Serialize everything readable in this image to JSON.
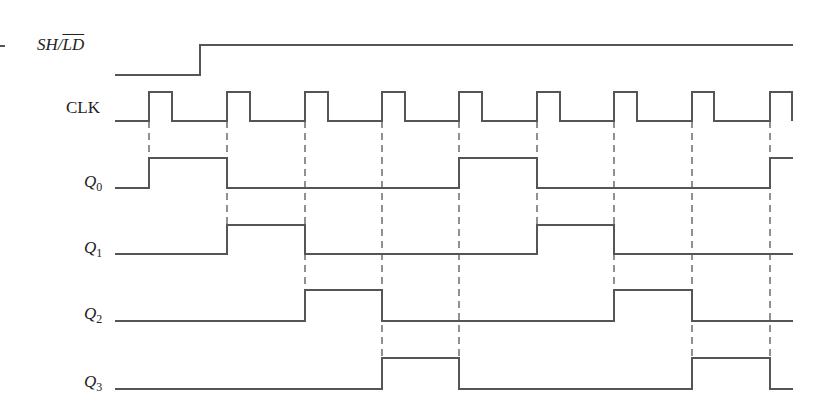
{
  "colors": {
    "signal": "#555555",
    "dashed": "#555555",
    "background": "#ffffff",
    "text": "#222222"
  },
  "signals": [
    {
      "name": "SH/LD",
      "label_main": "SH/",
      "label_over": "LD",
      "italic": true,
      "label_x": 37,
      "label_y": 36,
      "high_y": 45,
      "low_y": 75,
      "x_start": 115,
      "x_end": 793,
      "initial": 0,
      "transitions": [
        200
      ]
    },
    {
      "name": "CLK",
      "label_main": "CLK",
      "italic": false,
      "label_x": 66,
      "label_y": 99,
      "high_y": 92,
      "low_y": 121,
      "x_start": 115,
      "x_end": 792,
      "initial": 0,
      "transitions": [
        149,
        172,
        227,
        250,
        305,
        328,
        382,
        405,
        459,
        482,
        537,
        560,
        614,
        637,
        692,
        714,
        770,
        792
      ]
    },
    {
      "name": "Q0",
      "label_main": "Q",
      "label_sub": "0",
      "italic": true,
      "label_x": 84,
      "label_y": 173,
      "high_y": 158,
      "low_y": 188,
      "x_start": 115,
      "x_end": 793,
      "initial": 0,
      "transitions": [
        149,
        227,
        459,
        537,
        770
      ]
    },
    {
      "name": "Q1",
      "label_main": "Q",
      "label_sub": "1",
      "italic": true,
      "label_x": 84,
      "label_y": 239,
      "high_y": 225,
      "low_y": 254,
      "x_start": 115,
      "x_end": 793,
      "initial": 0,
      "transitions": [
        227,
        305,
        537,
        614
      ]
    },
    {
      "name": "Q2",
      "label_main": "Q",
      "label_sub": "2",
      "italic": true,
      "label_x": 84,
      "label_y": 305,
      "high_y": 290,
      "low_y": 321,
      "x_start": 115,
      "x_end": 793,
      "initial": 0,
      "transitions": [
        305,
        382,
        614,
        692
      ]
    },
    {
      "name": "Q3",
      "label_main": "Q",
      "label_sub": "3",
      "italic": true,
      "label_x": 84,
      "label_y": 373,
      "high_y": 358,
      "low_y": 389,
      "x_start": 115,
      "x_end": 793,
      "initial": 0,
      "transitions": [
        382,
        459,
        692,
        770
      ]
    }
  ],
  "clock_edges": [
    {
      "x": 149,
      "y_end": 158
    },
    {
      "x": 227,
      "y_end": 225
    },
    {
      "x": 305,
      "y_end": 290
    },
    {
      "x": 382,
      "y_end": 389
    },
    {
      "x": 459,
      "y_end": 389
    },
    {
      "x": 537,
      "y_end": 225
    },
    {
      "x": 614,
      "y_end": 290
    },
    {
      "x": 692,
      "y_end": 358
    },
    {
      "x": 770,
      "y_end": 389
    }
  ],
  "dashed_start_y": 121,
  "states": {
    "Q0": [
      0,
      1,
      0,
      0,
      0,
      1,
      0,
      0,
      0,
      1
    ],
    "Q1": [
      0,
      0,
      1,
      0,
      0,
      0,
      1,
      0,
      0,
      0
    ],
    "Q2": [
      0,
      0,
      0,
      1,
      0,
      0,
      0,
      1,
      0,
      0
    ],
    "Q3": [
      0,
      0,
      0,
      0,
      1,
      0,
      0,
      0,
      1,
      0
    ]
  }
}
